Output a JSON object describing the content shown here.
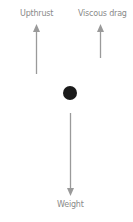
{
  "diagram": {
    "colors": {
      "background": "#ffffff",
      "arrow": "#9a9a9a",
      "label": "#8a8a8a",
      "ball": "#1a1a1a"
    },
    "forces": [
      {
        "label": "Upthrust",
        "direction": "up"
      },
      {
        "label": "Viscous drag",
        "direction": "up"
      },
      {
        "label": "Weight",
        "direction": "down"
      }
    ],
    "object": {
      "shape": "circle",
      "name": "ball"
    }
  }
}
